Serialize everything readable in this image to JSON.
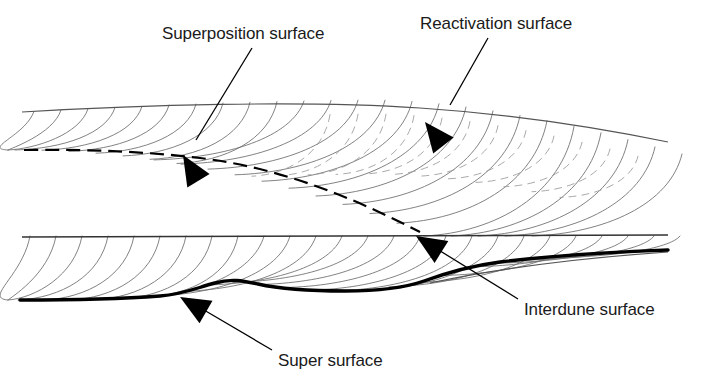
{
  "figure": {
    "kind": "geological-cross-section",
    "background_color": "#ffffff",
    "width": 701,
    "height": 385
  },
  "annotations": [
    {
      "id": "superposition",
      "label": "Superposition surface",
      "label_x": 162,
      "label_y": 25,
      "leader": {
        "x1": 252,
        "y1": 48,
        "x2": 196,
        "y2": 140
      },
      "arrow": {
        "tip_x": 183,
        "tip_y": 155,
        "angle": 239
      }
    },
    {
      "id": "reactivation",
      "label": "Reactivation surface",
      "label_x": 420,
      "label_y": 15,
      "leader": {
        "x1": 488,
        "y1": 38,
        "x2": 450,
        "y2": 105
      },
      "arrow": {
        "tip_x": 425,
        "tip_y": 122,
        "angle": 232
      }
    },
    {
      "id": "interdune",
      "label": "Interdune surface",
      "label_x": 524,
      "label_y": 301,
      "leader": {
        "x1": 518,
        "y1": 299,
        "x2": 437,
        "y2": 249
      },
      "arrow": {
        "tip_x": 416,
        "tip_y": 236,
        "angle": 212
      }
    },
    {
      "id": "super",
      "label": "Super surface",
      "label_x": 278,
      "label_y": 352,
      "leader": {
        "x1": 272,
        "y1": 350,
        "x2": 204,
        "y2": 310
      },
      "arrow": {
        "tip_x": 180,
        "tip_y": 297,
        "angle": 210
      }
    }
  ],
  "surfaces": {
    "top_boundary": {
      "name": "top-boundary-line",
      "color": "#555555",
      "width": 1.1,
      "style": "solid",
      "path": "M 22,112 C 140,105 300,100 420,108 C 510,114 590,126 668,142"
    },
    "superposition_surface": {
      "name": "superposition-surface-line",
      "color": "#000000",
      "width": 2.2,
      "style": "dashed",
      "dash": "14 7",
      "path": "M 24,150 C 90,149 150,152 200,158 C 280,168 350,196 420,232"
    },
    "interdune_surface": {
      "name": "interdune-surface-line",
      "color": "#333333",
      "width": 1.4,
      "style": "solid",
      "path": "M 22,237 L 668,235"
    },
    "super_surface": {
      "name": "super-surface-line",
      "color": "#000000",
      "width": 3.4,
      "style": "solid",
      "path": "M 20,300 C 70,300 120,299 160,296 C 184,294 196,288 215,283 C 232,278 244,281 258,284 C 280,289 310,291 345,291 C 380,291 404,288 424,281 C 446,273 470,266 500,262 C 550,256 610,252 668,250"
    },
    "lower_right_boundary": {
      "name": "lower-right-edge-line",
      "color": "#555555",
      "width": 1.1,
      "style": "solid",
      "path": "M 430,283 C 500,268 580,258 668,252"
    }
  },
  "laminae": {
    "name": "cross-bedding-laminae",
    "color": "#6b6b6b",
    "width": 0.85,
    "dashed_color": "#9a9a9a",
    "dashed_width": 0.85,
    "dash_pattern": "7 6",
    "set_upper_count": 22,
    "set_lower_count": 20,
    "note": "concave-up curved foresets dipping to the left"
  },
  "style": {
    "label_font_size": 17,
    "label_color": "#1a1a1a",
    "leader_color": "#000000",
    "leader_width": 1.3,
    "arrow_fill": "#000000",
    "arrow_length": 30,
    "arrow_half_width": 13
  }
}
